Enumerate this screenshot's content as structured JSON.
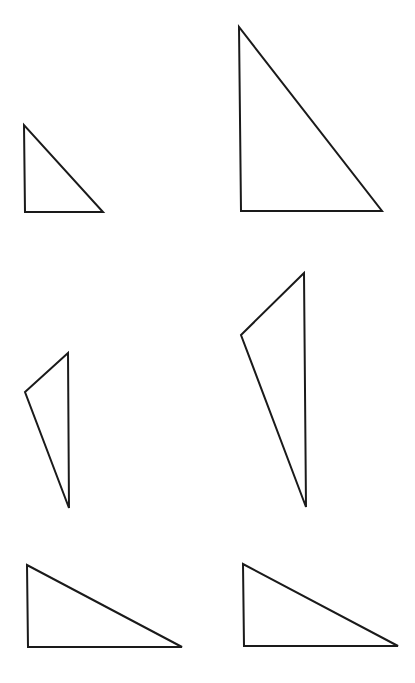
{
  "figure": {
    "background": "#ffffff",
    "stroke_color": "#1a1a1a",
    "stroke_width": 2,
    "layout": {
      "rows": 3,
      "columns": 2
    },
    "triangles": [
      {
        "id": "small-right-triangle",
        "row": 1,
        "col": 1,
        "shape": "right triangle",
        "points": "24,125 25,212 103,212"
      },
      {
        "id": "large-right-triangle",
        "row": 1,
        "col": 2,
        "shape": "right triangle",
        "points": "239,27 241,211 382,211"
      },
      {
        "id": "small-obtuse-triangle",
        "row": 2,
        "col": 1,
        "shape": "obtuse triangle",
        "points": "68,353 25,392 69,508"
      },
      {
        "id": "large-obtuse-triangle",
        "row": 2,
        "col": 2,
        "shape": "obtuse triangle",
        "points": "304,273 241,335 306,507"
      },
      {
        "id": "wide-right-triangle-left",
        "row": 3,
        "col": 1,
        "shape": "right triangle",
        "points": "27,565 28,647 182,647"
      },
      {
        "id": "wide-right-triangle-right",
        "row": 3,
        "col": 2,
        "shape": "right triangle",
        "points": "243,564 244,646 398,646"
      }
    ]
  }
}
